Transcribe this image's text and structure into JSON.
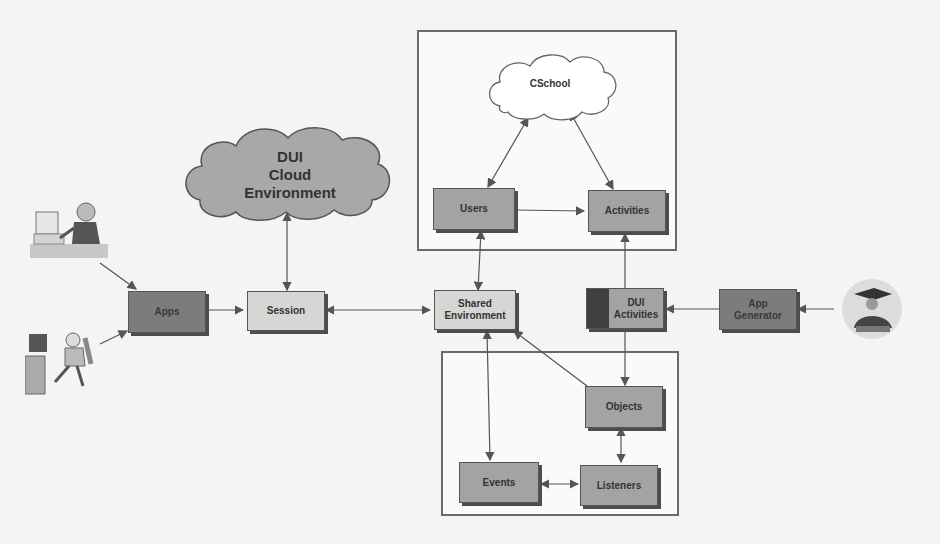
{
  "clouds": {
    "dui_cloud": "DUI\nCloud\nEnvironment",
    "cschool": "CSchool"
  },
  "nodes": {
    "apps": "Apps",
    "session": "Session",
    "shared_environment": "Shared\nEnvironment",
    "users": "Users",
    "activities": "Activities",
    "dui_activities": "DUI\nActivities",
    "app_generator": "App\nGenerator",
    "objects": "Objects",
    "events": "Events",
    "listeners": "Listeners"
  },
  "actors": [
    "user-at-computer",
    "user-relaxing-at-computer",
    "graduate-developer"
  ],
  "colors": {
    "dark_box": "#7c7c7c",
    "mid_box": "#a3a3a3",
    "light_box": "#d6d6d4",
    "line": "#555555"
  }
}
